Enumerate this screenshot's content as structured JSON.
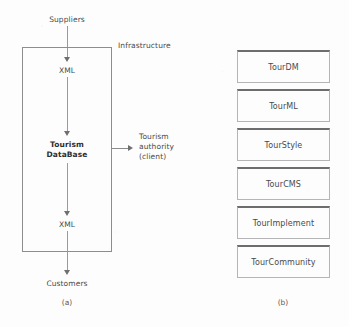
{
  "figure": {
    "panel_a": {
      "caption": "(a)",
      "boundary_label": "Infrastructure",
      "top_external_label": "Suppliers",
      "bottom_external_label": "Customers",
      "client_label": "Tourism\nauthority\n(client)",
      "client_label_lines": [
        "Tourism",
        "authority",
        "(client)"
      ],
      "nodes": [
        {
          "label": "XML",
          "bold": false
        },
        {
          "label": "Tourism\nDataBase",
          "bold": true,
          "lines": [
            "Tourism",
            "DataBase"
          ]
        },
        {
          "label": "XML",
          "bold": false
        }
      ],
      "flow_direction": "top-to-bottom",
      "line_color": "#9a9a9a",
      "border_color": "#8d8d8d"
    },
    "panel_b": {
      "caption": "(b)",
      "boxes": [
        {
          "label": "TourDM"
        },
        {
          "label": "TourML"
        },
        {
          "label": "TourStyle"
        },
        {
          "label": "TourCMS"
        },
        {
          "label": "TourImplement"
        },
        {
          "label": "TourCommunity"
        }
      ],
      "box_border_color": "#b5b5b5",
      "box_top_edge_color": "#6d6d6d"
    },
    "colors": {
      "background": "#fdfdfd",
      "text": "#4a4a4a",
      "text_bold": "#2e2e2e",
      "arrow": "#6f6f6f"
    }
  }
}
